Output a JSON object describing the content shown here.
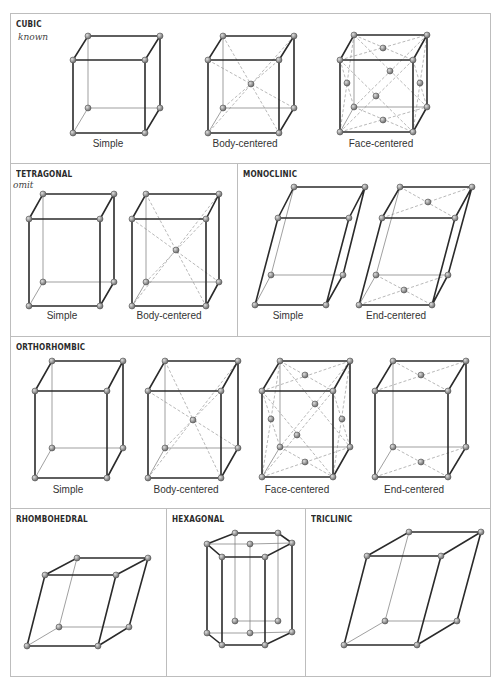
{
  "panels": {
    "cubic": {
      "title": "CUBIC",
      "note": "known",
      "captions": [
        "Simple",
        "Body-centered",
        "Face-centered"
      ]
    },
    "tetragonal": {
      "title": "TETRAGONAL",
      "note": "omit",
      "captions": [
        "Simple",
        "Body-centered"
      ]
    },
    "monoclinic": {
      "title": "MONOCLINIC",
      "captions": [
        "Simple",
        "End-centered"
      ]
    },
    "orthorhombic": {
      "title": "ORTHORHOMBIC",
      "captions": [
        "Simple",
        "Body-centered",
        "Face-centered",
        "End-centered"
      ]
    },
    "rhombohedral": {
      "title": "RHOMBOHEDRAL"
    },
    "hexagonal": {
      "title": "HEXAGONAL"
    },
    "triclinic": {
      "title": "TRICLINIC"
    }
  },
  "style": {
    "edge_color": "#2b2b2b",
    "atom_color": "#8a8a8a",
    "border_color": "#bdbdbd"
  }
}
